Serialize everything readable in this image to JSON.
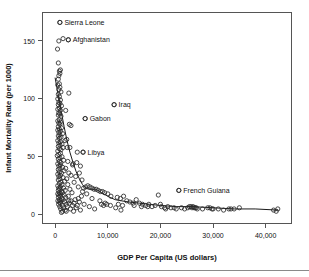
{
  "chart_data": {
    "type": "scatter",
    "title": "",
    "xlabel": "GDP Per Capita (US dollars)",
    "ylabel": "Infant Mortality Rate (per 1000)",
    "xlim": [
      -2500,
      45000
    ],
    "ylim": [
      -8,
      175
    ],
    "xticks": [
      0,
      10000,
      20000,
      30000,
      40000
    ],
    "xticklabels": [
      "0",
      "10,000",
      "20,000",
      "30,000",
      "40,000"
    ],
    "yticks": [
      0,
      50,
      100,
      150
    ],
    "yticklabels": [
      "0",
      "50",
      "100",
      "150"
    ],
    "grid": false,
    "legend": null,
    "marker": "open-circle",
    "marker_color": "#2b2b2b",
    "trend_line_color": "#1a1a1a",
    "annotations": [
      {
        "label": "Sierra Leone",
        "x": 900,
        "y": 166
      },
      {
        "label": "Afghanistan",
        "x": 2500,
        "y": 151
      },
      {
        "label": "Iraq",
        "x": 11200,
        "y": 95
      },
      {
        "label": "Gabon",
        "x": 5700,
        "y": 83
      },
      {
        "label": "Libya",
        "x": 5300,
        "y": 54
      },
      {
        "label": "French Guiana",
        "x": 23500,
        "y": 21
      }
    ],
    "points": [
      [
        900,
        166
      ],
      [
        2500,
        151
      ],
      [
        700,
        150
      ],
      [
        450,
        143
      ],
      [
        1500,
        152
      ],
      [
        600,
        131
      ],
      [
        800,
        124
      ],
      [
        900,
        122
      ],
      [
        700,
        120
      ],
      [
        1000,
        125
      ],
      [
        600,
        117
      ],
      [
        800,
        113
      ],
      [
        500,
        112
      ],
      [
        900,
        110
      ],
      [
        700,
        108
      ],
      [
        1100,
        106
      ],
      [
        2600,
        105
      ],
      [
        600,
        104
      ],
      [
        800,
        102
      ],
      [
        500,
        100
      ],
      [
        1000,
        99
      ],
      [
        700,
        97
      ],
      [
        900,
        96
      ],
      [
        600,
        95
      ],
      [
        1200,
        94
      ],
      [
        800,
        92
      ],
      [
        500,
        91
      ],
      [
        1000,
        90
      ],
      [
        2000,
        90
      ],
      [
        700,
        88
      ],
      [
        900,
        87
      ],
      [
        600,
        86
      ],
      [
        1100,
        85
      ],
      [
        5700,
        83
      ],
      [
        800,
        82
      ],
      [
        500,
        81
      ],
      [
        1000,
        80
      ],
      [
        700,
        79
      ],
      [
        900,
        78
      ],
      [
        3000,
        77
      ],
      [
        600,
        76
      ],
      [
        1200,
        75
      ],
      [
        800,
        74
      ],
      [
        500,
        73
      ],
      [
        1000,
        72
      ],
      [
        700,
        71
      ],
      [
        1400,
        70
      ],
      [
        900,
        69
      ],
      [
        600,
        68
      ],
      [
        1100,
        67
      ],
      [
        800,
        66
      ],
      [
        2200,
        65
      ],
      [
        500,
        64
      ],
      [
        1000,
        63
      ],
      [
        700,
        62
      ],
      [
        1300,
        61
      ],
      [
        900,
        60
      ],
      [
        600,
        59
      ],
      [
        1500,
        58
      ],
      [
        2800,
        58
      ],
      [
        800,
        57
      ],
      [
        1100,
        56
      ],
      [
        500,
        55
      ],
      [
        5300,
        54
      ],
      [
        4200,
        54
      ],
      [
        1000,
        53
      ],
      [
        700,
        52
      ],
      [
        400,
        51
      ],
      [
        1300,
        50
      ],
      [
        900,
        49
      ],
      [
        600,
        48
      ],
      [
        1600,
        47
      ],
      [
        800,
        46
      ],
      [
        2400,
        46
      ],
      [
        1100,
        45
      ],
      [
        500,
        44
      ],
      [
        3400,
        44
      ],
      [
        1000,
        43
      ],
      [
        4800,
        42
      ],
      [
        700,
        42
      ],
      [
        1400,
        41
      ],
      [
        900,
        40
      ],
      [
        2000,
        40
      ],
      [
        600,
        39
      ],
      [
        1700,
        38
      ],
      [
        800,
        37
      ],
      [
        1200,
        36
      ],
      [
        2600,
        36
      ],
      [
        500,
        35
      ],
      [
        1000,
        34
      ],
      [
        3000,
        34
      ],
      [
        700,
        33
      ],
      [
        1500,
        32
      ],
      [
        900,
        31
      ],
      [
        2200,
        31
      ],
      [
        600,
        30
      ],
      [
        1800,
        29
      ],
      [
        1100,
        28
      ],
      [
        3600,
        28
      ],
      [
        800,
        27
      ],
      [
        1300,
        26
      ],
      [
        2400,
        26
      ],
      [
        500,
        25
      ],
      [
        1000,
        24
      ],
      [
        4400,
        24
      ],
      [
        700,
        23
      ],
      [
        1600,
        23
      ],
      [
        900,
        22
      ],
      [
        2800,
        22
      ],
      [
        600,
        21
      ],
      [
        1900,
        21
      ],
      [
        1200,
        20
      ],
      [
        5200,
        20
      ],
      [
        800,
        19
      ],
      [
        1400,
        19
      ],
      [
        3200,
        19
      ],
      [
        500,
        18
      ],
      [
        1050,
        18
      ],
      [
        6000,
        18
      ],
      [
        700,
        17
      ],
      [
        1700,
        17
      ],
      [
        950,
        16
      ],
      [
        2500,
        16
      ],
      [
        620,
        15
      ],
      [
        2000,
        15
      ],
      [
        1250,
        14
      ],
      [
        7000,
        14
      ],
      [
        850,
        13
      ],
      [
        1500,
        13
      ],
      [
        3800,
        13
      ],
      [
        520,
        12
      ],
      [
        1100,
        12
      ],
      [
        8500,
        12
      ],
      [
        750,
        11
      ],
      [
        1800,
        11
      ],
      [
        4600,
        11
      ],
      [
        980,
        10
      ],
      [
        2700,
        10
      ],
      [
        9500,
        10
      ],
      [
        650,
        9
      ],
      [
        2100,
        9
      ],
      [
        5500,
        9
      ],
      [
        1350,
        8
      ],
      [
        3300,
        8
      ],
      [
        10500,
        8
      ],
      [
        880,
        7
      ],
      [
        2300,
        7
      ],
      [
        6500,
        7
      ],
      [
        1600,
        6
      ],
      [
        4000,
        6
      ],
      [
        11500,
        6
      ],
      [
        1050,
        5
      ],
      [
        2900,
        5
      ],
      [
        7500,
        5
      ],
      [
        1900,
        4
      ],
      [
        4800,
        4
      ],
      [
        12500,
        4
      ],
      [
        1400,
        3
      ],
      [
        3500,
        3
      ],
      [
        5800,
        24
      ],
      [
        6200,
        25
      ],
      [
        6600,
        24
      ],
      [
        7000,
        23
      ],
      [
        5400,
        23
      ],
      [
        7400,
        22
      ],
      [
        7800,
        22
      ],
      [
        8200,
        21
      ],
      [
        8600,
        20
      ],
      [
        9000,
        20
      ],
      [
        9400,
        19
      ],
      [
        10000,
        18
      ],
      [
        10600,
        16
      ],
      [
        11200,
        95
      ],
      [
        11800,
        15
      ],
      [
        12400,
        14
      ],
      [
        13000,
        16
      ],
      [
        13600,
        12
      ],
      [
        14200,
        11
      ],
      [
        14800,
        10
      ],
      [
        15400,
        13
      ],
      [
        16000,
        10
      ],
      [
        16600,
        9
      ],
      [
        17200,
        8
      ],
      [
        17800,
        9
      ],
      [
        18400,
        7
      ],
      [
        19000,
        8
      ],
      [
        19600,
        17
      ],
      [
        20200,
        7
      ],
      [
        20800,
        6
      ],
      [
        21400,
        7
      ],
      [
        22000,
        6
      ],
      [
        22600,
        6
      ],
      [
        23000,
        5
      ],
      [
        23500,
        21
      ],
      [
        24000,
        6
      ],
      [
        24600,
        5
      ],
      [
        25200,
        6
      ],
      [
        25800,
        7
      ],
      [
        26000,
        6
      ],
      [
        26200,
        7
      ],
      [
        26400,
        6
      ],
      [
        26600,
        6
      ],
      [
        27000,
        5
      ],
      [
        28000,
        5
      ],
      [
        29000,
        6
      ],
      [
        29400,
        6
      ],
      [
        30000,
        5
      ],
      [
        31000,
        5
      ],
      [
        33000,
        5
      ],
      [
        33400,
        5
      ],
      [
        35000,
        6
      ],
      [
        41500,
        4
      ],
      [
        42000,
        3
      ],
      [
        42300,
        5
      ],
      [
        9200,
        8
      ],
      [
        9800,
        9
      ],
      [
        8800,
        9
      ],
      [
        12000,
        9
      ],
      [
        12800,
        8
      ],
      [
        16400,
        7
      ],
      [
        17600,
        7
      ],
      [
        15000,
        8
      ],
      [
        20000,
        9
      ],
      [
        21000,
        5
      ],
      [
        25500,
        7
      ],
      [
        26800,
        6
      ],
      [
        29800,
        5
      ],
      [
        32000,
        4
      ],
      [
        34000,
        5
      ],
      [
        1200,
        2
      ],
      [
        2100,
        3
      ],
      [
        4200,
        8
      ],
      [
        3600,
        10
      ],
      [
        4400,
        14
      ],
      [
        5000,
        16
      ],
      [
        2600,
        12
      ],
      [
        3000,
        12
      ],
      [
        3900,
        33
      ],
      [
        4600,
        36
      ],
      [
        3300,
        43
      ],
      [
        2300,
        58
      ],
      [
        1900,
        64
      ],
      [
        2700,
        78
      ],
      [
        4100,
        45
      ],
      [
        5100,
        30
      ]
    ],
    "trend_path": [
      [
        0,
        118
      ],
      [
        400,
        108
      ],
      [
        800,
        98
      ],
      [
        1200,
        88
      ],
      [
        1700,
        76
      ],
      [
        2200,
        65
      ],
      [
        2800,
        54
      ],
      [
        3400,
        45
      ],
      [
        4000,
        37
      ],
      [
        4600,
        31
      ],
      [
        5200,
        26
      ],
      [
        5800,
        23
      ],
      [
        6400,
        22
      ],
      [
        7000,
        22
      ],
      [
        7600,
        22
      ],
      [
        8200,
        21
      ],
      [
        8800,
        19
      ],
      [
        9600,
        17
      ],
      [
        10400,
        15
      ],
      [
        11400,
        13
      ],
      [
        12600,
        12
      ],
      [
        14000,
        11
      ],
      [
        16000,
        10
      ],
      [
        18000,
        9
      ],
      [
        20000,
        8
      ],
      [
        23000,
        7
      ],
      [
        26000,
        7
      ],
      [
        30000,
        6
      ],
      [
        34000,
        5
      ],
      [
        38000,
        5
      ],
      [
        42300,
        4
      ]
    ]
  },
  "figure": {
    "plot_frame": {
      "left": 42,
      "top": 12,
      "right": 292,
      "bottom": 224
    }
  }
}
